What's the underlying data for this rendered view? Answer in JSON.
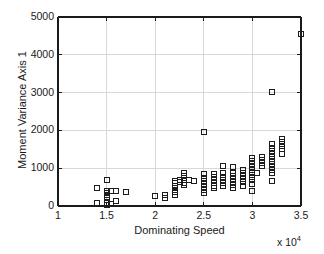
{
  "chart_data": {
    "type": "scatter",
    "title": "",
    "xlabel": "Dominating Speed",
    "ylabel": "Moment Variance Axis 1",
    "x_exponent_label": "x 10",
    "x_exponent_power": "4",
    "x_scale_multiplier": 10000,
    "xlim": [
      10000,
      35000
    ],
    "ylim": [
      0,
      5000
    ],
    "xticks": [
      1,
      1.5,
      2,
      2.5,
      3,
      3.5
    ],
    "xtick_labels": [
      "1",
      "1.5",
      "2",
      "2.5",
      "3",
      "3.5"
    ],
    "yticks": [
      0,
      1000,
      2000,
      3000,
      4000,
      5000
    ],
    "ytick_labels": [
      "0",
      "1000",
      "2000",
      "3000",
      "4000",
      "5000"
    ],
    "grid": true,
    "legend": "none",
    "marker_style": "open-square",
    "marker_color": "#1c1c1c",
    "marker_size_px": 6,
    "series": [
      {
        "name": "Moment Variance Axis 1 vs Dominating Speed",
        "points": [
          [
            14000,
            80
          ],
          [
            14000,
            470
          ],
          [
            15000,
            30
          ],
          [
            15000,
            90
          ],
          [
            15000,
            150
          ],
          [
            15000,
            200
          ],
          [
            15000,
            250
          ],
          [
            15000,
            300
          ],
          [
            15000,
            350
          ],
          [
            15000,
            410
          ],
          [
            15000,
            690
          ],
          [
            15500,
            60
          ],
          [
            15500,
            400
          ],
          [
            16000,
            120
          ],
          [
            16000,
            400
          ],
          [
            17000,
            360
          ],
          [
            20000,
            270
          ],
          [
            21000,
            200
          ],
          [
            21000,
            280
          ],
          [
            22000,
            300
          ],
          [
            22000,
            360
          ],
          [
            22000,
            420
          ],
          [
            22000,
            480
          ],
          [
            22000,
            540
          ],
          [
            22000,
            600
          ],
          [
            22000,
            660
          ],
          [
            22500,
            640
          ],
          [
            22500,
            700
          ],
          [
            23000,
            560
          ],
          [
            23000,
            620
          ],
          [
            23000,
            680
          ],
          [
            23000,
            740
          ],
          [
            23000,
            800
          ],
          [
            23000,
            880
          ],
          [
            23500,
            690
          ],
          [
            24000,
            660
          ],
          [
            25000,
            340
          ],
          [
            25000,
            420
          ],
          [
            25000,
            500
          ],
          [
            25000,
            580
          ],
          [
            25000,
            660
          ],
          [
            25000,
            740
          ],
          [
            25000,
            840
          ],
          [
            25000,
            1970
          ],
          [
            26000,
            470
          ],
          [
            26000,
            540
          ],
          [
            26000,
            610
          ],
          [
            26000,
            690
          ],
          [
            26000,
            760
          ],
          [
            26000,
            840
          ],
          [
            27000,
            540
          ],
          [
            27000,
            620
          ],
          [
            27000,
            700
          ],
          [
            27000,
            780
          ],
          [
            27000,
            860
          ],
          [
            27000,
            1060
          ],
          [
            28000,
            480
          ],
          [
            28000,
            560
          ],
          [
            28000,
            640
          ],
          [
            28000,
            720
          ],
          [
            28000,
            800
          ],
          [
            28000,
            880
          ],
          [
            28000,
            1040
          ],
          [
            29000,
            540
          ],
          [
            29000,
            640
          ],
          [
            29000,
            720
          ],
          [
            29000,
            800
          ],
          [
            29000,
            880
          ],
          [
            29000,
            940
          ],
          [
            30000,
            410
          ],
          [
            30000,
            580
          ],
          [
            30000,
            700
          ],
          [
            30000,
            780
          ],
          [
            30000,
            860
          ],
          [
            30000,
            940
          ],
          [
            30000,
            1020
          ],
          [
            30000,
            1100
          ],
          [
            30000,
            1180
          ],
          [
            30000,
            1270
          ],
          [
            30500,
            880
          ],
          [
            31000,
            1060
          ],
          [
            31000,
            1140
          ],
          [
            31000,
            1220
          ],
          [
            31000,
            1290
          ],
          [
            32000,
            650
          ],
          [
            32000,
            880
          ],
          [
            32000,
            960
          ],
          [
            32000,
            1040
          ],
          [
            32000,
            1120
          ],
          [
            32000,
            1200
          ],
          [
            32000,
            1290
          ],
          [
            32000,
            1380
          ],
          [
            32000,
            1460
          ],
          [
            32000,
            1540
          ],
          [
            32000,
            1650
          ],
          [
            32000,
            3010
          ],
          [
            33000,
            1370
          ],
          [
            33000,
            1520
          ],
          [
            33000,
            1600
          ],
          [
            33000,
            1680
          ],
          [
            33000,
            1760
          ],
          [
            35000,
            4550
          ]
        ]
      }
    ]
  },
  "plot_box": {
    "left": 58,
    "top": 17,
    "width": 243,
    "height": 189
  },
  "colors": {
    "axis": "#1a1a1a",
    "grid": "#d8d8d8",
    "marker": "#1c1c1c",
    "background": "#ffffff"
  }
}
